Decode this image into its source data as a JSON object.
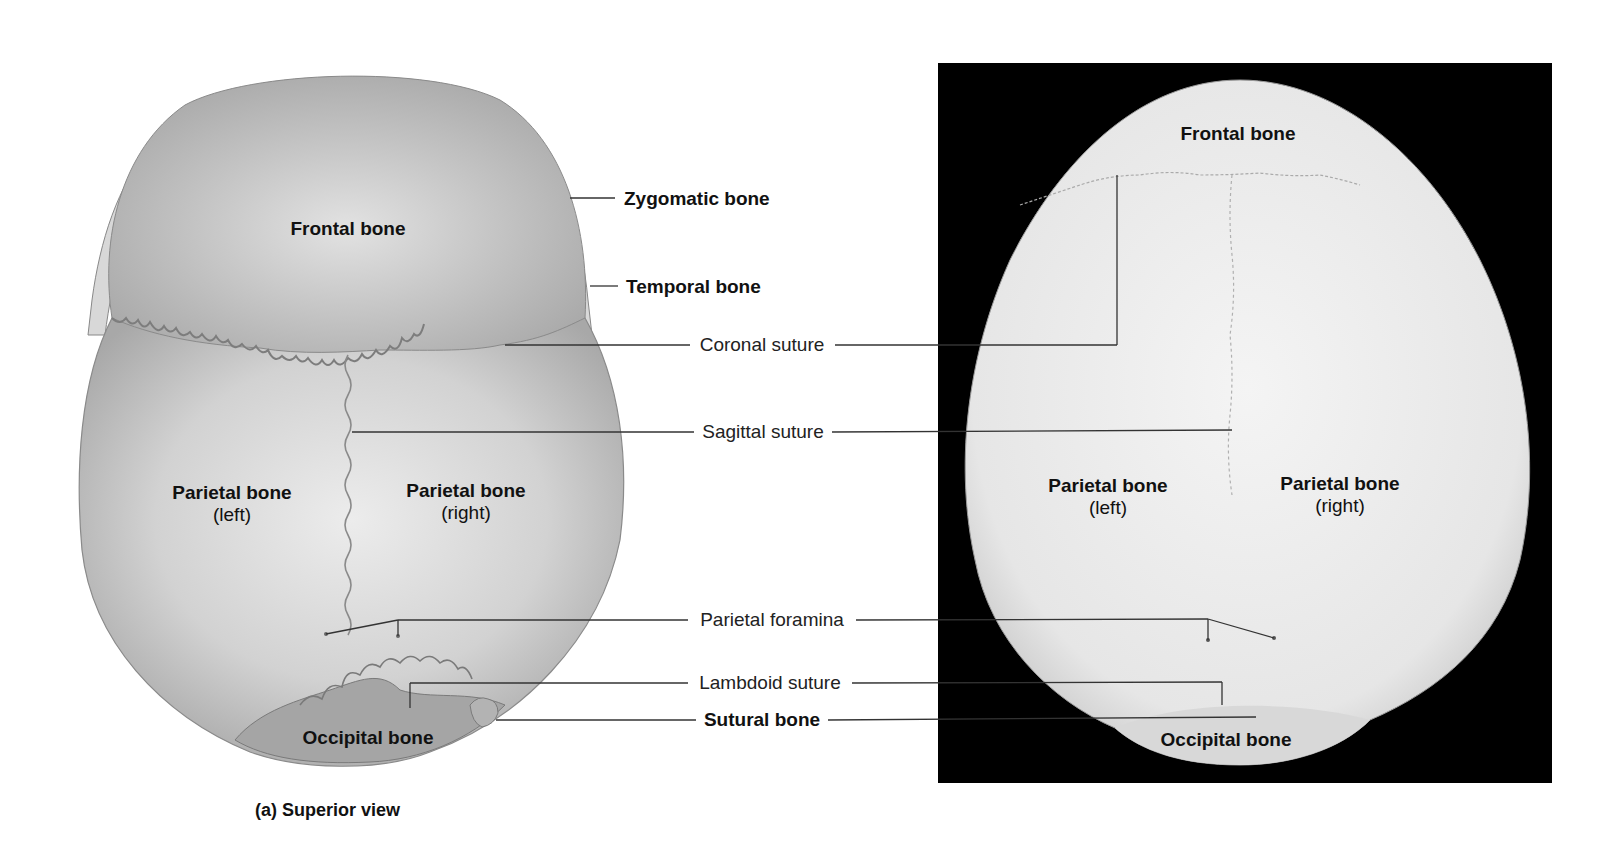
{
  "figure": {
    "caption": "(a) Superior view",
    "colors": {
      "background": "#ffffff",
      "photo_backdrop": "#000000",
      "illustration_bone": "#cfcfcf",
      "illustration_occipital": "#9a9a9a",
      "photo_bone": "#ececec",
      "leader_line": "#333333"
    }
  },
  "illustration": {
    "name": "Superior view illustration",
    "labels": {
      "frontal": "Frontal bone",
      "parietal_left": "Parietal bone",
      "parietal_left_side": "(left)",
      "parietal_right": "Parietal bone",
      "parietal_right_side": "(right)",
      "occipital": "Occipital bone"
    }
  },
  "photo": {
    "name": "Superior view photograph",
    "labels": {
      "frontal": "Frontal bone",
      "parietal_left": "Parietal bone",
      "parietal_left_side": "(left)",
      "parietal_right": "Parietal bone",
      "parietal_right_side": "(right)",
      "occipital": "Occipital bone"
    }
  },
  "callouts": [
    {
      "id": "zygomatic",
      "label": "Zygomatic bone",
      "bold": true
    },
    {
      "id": "temporal",
      "label": "Temporal bone",
      "bold": true
    },
    {
      "id": "coronal",
      "label": "Coronal suture",
      "bold": false
    },
    {
      "id": "sagittal",
      "label": "Sagittal suture",
      "bold": false
    },
    {
      "id": "parietal_foramina",
      "label": "Parietal foramina",
      "bold": false
    },
    {
      "id": "lambdoid",
      "label": "Lambdoid suture",
      "bold": false
    },
    {
      "id": "sutural",
      "label": "Sutural bone",
      "bold": true
    }
  ]
}
